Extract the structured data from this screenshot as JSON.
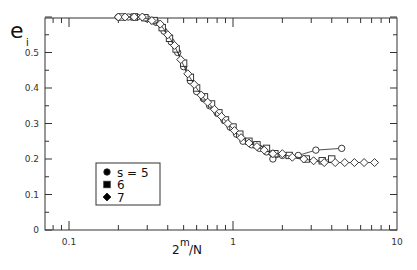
{
  "chart_data": {
    "type": "scatter",
    "title": "",
    "ylabel": "e",
    "ylabel_subscript": "i",
    "xlabel_base": "2",
    "xlabel_sup": "m",
    "xlabel_tail": "/N",
    "xscale": "log",
    "xlim": [
      0.05,
      10
    ],
    "ylim": [
      0,
      0.6
    ],
    "grid": false,
    "x_ticks": [
      {
        "v": 0.1,
        "label": "0.1"
      },
      {
        "v": 1,
        "label": "1"
      },
      {
        "v": 10,
        "label": "10"
      }
    ],
    "y_ticks": [
      {
        "v": 0,
        "label": "0"
      },
      {
        "v": 0.1,
        "label": "0.1"
      },
      {
        "v": 0.2,
        "label": "0.2"
      },
      {
        "v": 0.3,
        "label": "0.3"
      },
      {
        "v": 0.4,
        "label": "0.4"
      },
      {
        "v": 0.5,
        "label": "0.5"
      }
    ],
    "legend": {
      "position": "lower-left",
      "title": "s",
      "entries": [
        {
          "marker": "circle",
          "label": "s  = 5"
        },
        {
          "marker": "square",
          "label": "6"
        },
        {
          "marker": "diamond",
          "label": "7"
        }
      ]
    },
    "series": [
      {
        "name": "s = 5",
        "marker": "circle",
        "x": [
          0.2,
          0.23,
          0.26,
          0.3,
          0.34,
          0.38,
          0.42,
          0.46,
          0.5,
          0.55,
          0.6,
          0.66,
          0.72,
          0.8,
          0.88,
          0.96,
          1.05,
          1.15,
          1.3,
          1.45,
          1.6,
          1.75,
          2.0,
          2.5,
          3.2,
          4.6
        ],
        "y": [
          0.6,
          0.6,
          0.6,
          0.595,
          0.585,
          0.56,
          0.53,
          0.5,
          0.46,
          0.42,
          0.39,
          0.37,
          0.35,
          0.33,
          0.31,
          0.29,
          0.27,
          0.25,
          0.24,
          0.23,
          0.22,
          0.2,
          0.21,
          0.21,
          0.225,
          0.23
        ]
      },
      {
        "name": "s = 6",
        "marker": "square",
        "x": [
          0.21,
          0.25,
          0.29,
          0.33,
          0.37,
          0.41,
          0.45,
          0.5,
          0.55,
          0.6,
          0.67,
          0.74,
          0.82,
          0.9,
          1.0,
          1.1,
          1.25,
          1.4,
          1.6,
          1.8,
          2.2,
          2.8,
          3.5,
          4.0
        ],
        "y": [
          0.6,
          0.6,
          0.598,
          0.59,
          0.57,
          0.54,
          0.51,
          0.47,
          0.43,
          0.4,
          0.375,
          0.355,
          0.33,
          0.31,
          0.29,
          0.27,
          0.25,
          0.24,
          0.23,
          0.215,
          0.21,
          0.2,
          0.195,
          0.2
        ]
      },
      {
        "name": "s = 7",
        "marker": "diamond",
        "x": [
          0.2,
          0.22,
          0.25,
          0.28,
          0.32,
          0.36,
          0.4,
          0.44,
          0.48,
          0.53,
          0.58,
          0.64,
          0.7,
          0.77,
          0.85,
          0.93,
          1.02,
          1.12,
          1.25,
          1.4,
          1.55,
          1.75,
          2.0,
          2.3,
          2.7,
          3.1,
          3.6,
          4.2,
          4.8,
          5.5,
          6.3,
          7.3
        ],
        "y": [
          0.6,
          0.6,
          0.6,
          0.6,
          0.59,
          0.58,
          0.55,
          0.52,
          0.48,
          0.44,
          0.41,
          0.38,
          0.36,
          0.34,
          0.32,
          0.3,
          0.28,
          0.26,
          0.245,
          0.235,
          0.225,
          0.215,
          0.215,
          0.205,
          0.2,
          0.195,
          0.19,
          0.19,
          0.19,
          0.19,
          0.19,
          0.19
        ]
      }
    ]
  }
}
